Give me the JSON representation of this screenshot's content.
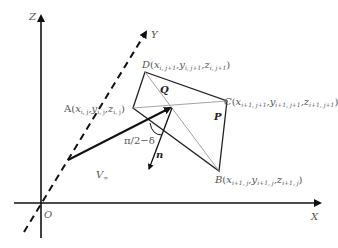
{
  "diagram": {
    "axes": {
      "x_label": "X",
      "y_label": "Y",
      "z_label": "Z",
      "origin_label": "O"
    },
    "vertices": {
      "A": {
        "name": "A",
        "coords": "(x",
        "sub_x": "i, j",
        "y": "y",
        "sub_y": "i, j",
        "z": "z",
        "sub_z": "i, j"
      },
      "B": {
        "name": "B",
        "coords": "(x",
        "sub_x": "i+1, j",
        "y": "y",
        "sub_y": "i+1, j",
        "z": "z",
        "sub_z": "i+1, j"
      },
      "C": {
        "name": "C",
        "coords": "(x",
        "sub_x": "i+1, j+1",
        "y": "y",
        "sub_y": "i+1, j+1",
        "z": "z",
        "sub_z": "i+1, j+1"
      },
      "D": {
        "name": "D",
        "coords": "(x",
        "sub_x": "i, j+1",
        "y": "y",
        "sub_y": "i, j+1",
        "z": "z",
        "sub_z": "i, j+1"
      }
    },
    "points": {
      "P": "P",
      "Q": "Q"
    },
    "vectors": {
      "freestream": "V",
      "freestream_sub": "∞",
      "normal": "n",
      "angle": "π/2−δ"
    }
  }
}
